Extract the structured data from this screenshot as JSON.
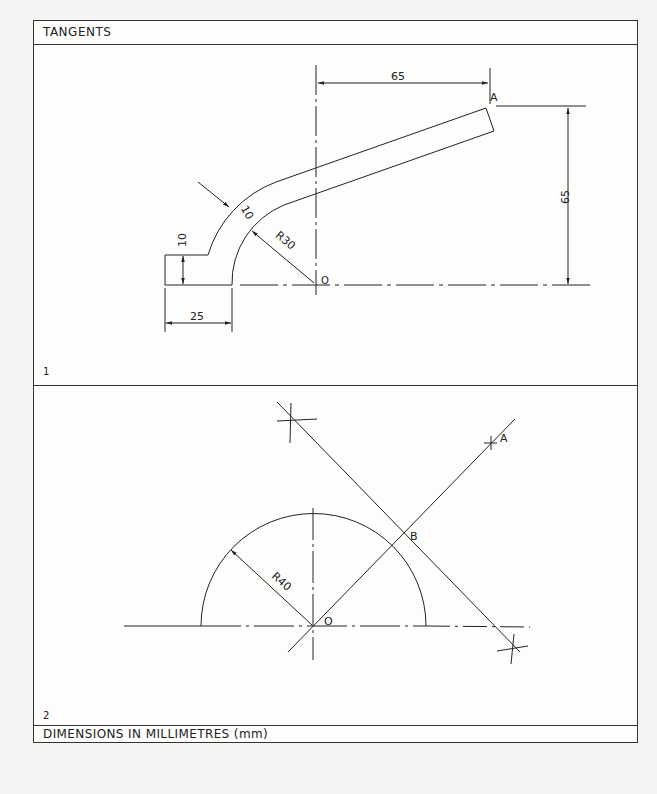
{
  "header": {
    "title": "TANGENTS"
  },
  "footer": {
    "text": "DIMENSIONS IN MILLIMETRES (mm)"
  },
  "panels": [
    {
      "number": "1",
      "labels": {
        "point_a": "A",
        "point_o": "O",
        "dim_horizontal": "65",
        "dim_vertical": "65",
        "dim_width": "25",
        "dim_step": "10",
        "dim_thickness": "10",
        "dim_radius": "R30"
      }
    },
    {
      "number": "2",
      "labels": {
        "point_a": "A",
        "point_b": "B",
        "point_o": "O",
        "dim_radius": "R40"
      }
    }
  ],
  "colors": {
    "line": "#222222",
    "paper": "#fdfdfc",
    "background": "#f4f4f2"
  }
}
